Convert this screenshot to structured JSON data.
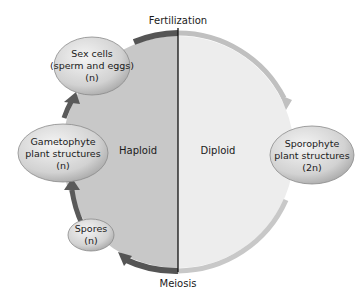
{
  "diagram": {
    "title_top": "Fertilization",
    "title_bottom": "Meiosis",
    "halves": {
      "left_label": "Haploid",
      "right_label": "Diploid"
    },
    "nodes": [
      {
        "id": "sex-cells",
        "line1": "Sex cells",
        "line2": "(sperm and eggs)",
        "line3": "(n)"
      },
      {
        "id": "gametophyte",
        "line1": "Gametophyte",
        "line2": "plant structures",
        "line3": "(n)"
      },
      {
        "id": "spores",
        "line1": "Spores",
        "line2": "(n)"
      },
      {
        "id": "sporophyte",
        "line1": "Sporophyte",
        "line2": "plant structures",
        "line3": "(2n)"
      }
    ],
    "colors": {
      "haploid_fill": "#c8c8c8",
      "diploid_fill": "#ededed",
      "dark_arrow": "#5a5a5a",
      "light_arrow": "#bdbdbd",
      "divider": "#111111"
    }
  }
}
